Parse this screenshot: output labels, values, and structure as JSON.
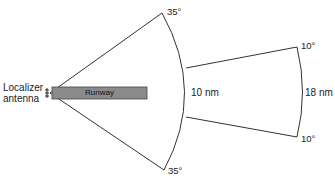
{
  "diagram": {
    "labels": {
      "antenna_line1": "Localizer",
      "antenna_line2": "antenna",
      "runway": "Runway",
      "angle_top_wide": "35°",
      "angle_bottom_wide": "35°",
      "angle_top_narrow": "10°",
      "angle_bottom_narrow": "10°",
      "inner_distance": "10 nm",
      "outer_distance": "18 nm"
    },
    "colors": {
      "line": "#333333",
      "runway_fill": "#8a8a8a",
      "runway_stroke": "#444444",
      "background": "#ffffff"
    }
  }
}
